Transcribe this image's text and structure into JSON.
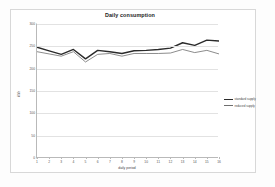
{
  "chart_data": {
    "type": "line",
    "title": "Daily consumption",
    "xlabel": "daily period",
    "ylabel": "kWh",
    "x": [
      1,
      2,
      3,
      4,
      5,
      6,
      7,
      8,
      9,
      10,
      11,
      12,
      13,
      14,
      15,
      16
    ],
    "categories": [
      "1",
      "2",
      "3",
      "4",
      "5",
      "6",
      "7",
      "8",
      "9",
      "10",
      "11",
      "12",
      "13",
      "14",
      "15",
      "16"
    ],
    "series": [
      {
        "name": "standard supply",
        "color": "#2b2b2b",
        "width": 1.4,
        "values": [
          248,
          240,
          232,
          243,
          222,
          241,
          238,
          234,
          240,
          241,
          243,
          246,
          258,
          252,
          264,
          262
        ]
      },
      {
        "name": "reduced supply",
        "color": "#6e6e6e",
        "width": 0.8,
        "values": [
          238,
          233,
          228,
          238,
          215,
          232,
          234,
          228,
          234,
          234,
          234,
          235,
          243,
          236,
          241,
          233
        ]
      }
    ],
    "ylim": [
      0,
      300
    ],
    "yticks": [
      0,
      50,
      100,
      150,
      200,
      250,
      300
    ],
    "ytick_labels": [
      "0",
      "50",
      "100",
      "150",
      "200",
      "250",
      "300"
    ],
    "xlim": [
      1,
      16
    ],
    "grid": true,
    "grid_color": "#e2e2e2",
    "legend_position": "right",
    "markers": false
  }
}
